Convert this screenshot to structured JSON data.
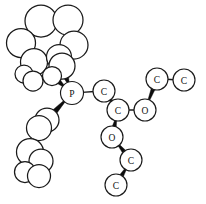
{
  "figure": {
    "background_color": "#ffffff",
    "stroke_color": "#1a1a1a",
    "bond_color": "#0d0d0d",
    "width": 206,
    "height": 204
  },
  "atoms": [
    {
      "id": "p1",
      "label": "P",
      "x": 72,
      "y": 93,
      "r": 11.5,
      "kind": "labeled"
    },
    {
      "id": "c1",
      "label": "C",
      "x": 104,
      "y": 91,
      "r": 11.0,
      "kind": "labeled"
    },
    {
      "id": "c2",
      "label": "C",
      "x": 118,
      "y": 110,
      "r": 11.0,
      "kind": "labeled"
    },
    {
      "id": "o1",
      "label": "O",
      "x": 145,
      "y": 110,
      "r": 11.0,
      "kind": "labeled"
    },
    {
      "id": "c3",
      "label": "C",
      "x": 157,
      "y": 79,
      "r": 11.0,
      "kind": "labeled"
    },
    {
      "id": "c4",
      "label": "C",
      "x": 184,
      "y": 80,
      "r": 11.0,
      "kind": "labeled"
    },
    {
      "id": "o2",
      "label": "O",
      "x": 112,
      "y": 137,
      "r": 11.0,
      "kind": "labeled"
    },
    {
      "id": "c5",
      "label": "C",
      "x": 131,
      "y": 160,
      "r": 11.0,
      "kind": "labeled"
    },
    {
      "id": "c6",
      "label": "C",
      "x": 116,
      "y": 185,
      "r": 11.0,
      "kind": "labeled"
    },
    {
      "id": "r1",
      "label": "",
      "x": 41,
      "y": 21,
      "r": 16.0,
      "kind": "plain"
    },
    {
      "id": "r2",
      "label": "",
      "x": 68,
      "y": 20,
      "r": 15.0,
      "kind": "plain"
    },
    {
      "id": "r3",
      "label": "",
      "x": 21,
      "y": 43,
      "r": 14.5,
      "kind": "plain"
    },
    {
      "id": "r4",
      "label": "",
      "x": 74,
      "y": 45,
      "r": 14.0,
      "kind": "plain"
    },
    {
      "id": "r5",
      "label": "",
      "x": 34,
      "y": 62,
      "r": 13.5,
      "kind": "plain"
    },
    {
      "id": "r6",
      "label": "",
      "x": 59,
      "y": 57,
      "r": 12.5,
      "kind": "plain"
    },
    {
      "id": "r7",
      "label": "",
      "x": 62,
      "y": 66,
      "r": 13.0,
      "kind": "plain"
    },
    {
      "id": "r8",
      "label": "",
      "x": 24,
      "y": 74,
      "r": 9.0,
      "kind": "plain"
    },
    {
      "id": "r9",
      "label": "",
      "x": 33,
      "y": 81,
      "r": 10.0,
      "kind": "plain"
    },
    {
      "id": "r10",
      "label": "",
      "x": 52,
      "y": 76,
      "r": 9.5,
      "kind": "plain"
    },
    {
      "id": "s1",
      "label": "",
      "x": 47,
      "y": 120,
      "r": 12.0,
      "kind": "plain"
    },
    {
      "id": "s2",
      "label": "",
      "x": 39,
      "y": 128,
      "r": 12.5,
      "kind": "plain"
    },
    {
      "id": "s3",
      "label": "",
      "x": 30,
      "y": 152,
      "r": 13.5,
      "kind": "plain"
    },
    {
      "id": "s4",
      "label": "",
      "x": 41,
      "y": 161,
      "r": 12.0,
      "kind": "plain"
    },
    {
      "id": "s5",
      "label": "",
      "x": 25,
      "y": 172,
      "r": 10.5,
      "kind": "plain"
    },
    {
      "id": "s6",
      "label": "",
      "x": 39,
      "y": 176,
      "r": 11.5,
      "kind": "plain"
    }
  ],
  "bonds": [
    {
      "from": "p1",
      "to": "c1",
      "style": "thin"
    },
    {
      "from": "c1",
      "to": "c2",
      "style": "wedge",
      "w1": 1.6,
      "w2": 4.2
    },
    {
      "from": "c2",
      "to": "o1",
      "style": "thin"
    },
    {
      "from": "o1",
      "to": "c3",
      "style": "wedge",
      "w1": 1.6,
      "w2": 4.2
    },
    {
      "from": "c3",
      "to": "c4",
      "style": "thin"
    },
    {
      "from": "c2",
      "to": "o2",
      "style": "wedge",
      "w1": 1.6,
      "w2": 4.4
    },
    {
      "from": "o2",
      "to": "c5",
      "style": "wedge",
      "w1": 1.6,
      "w2": 4.4
    },
    {
      "from": "c5",
      "to": "c6",
      "style": "wedge",
      "w1": 1.6,
      "w2": 4.4
    },
    {
      "from": "p1",
      "to": "r7",
      "style": "wedge",
      "w1": 1.6,
      "w2": 5.2
    },
    {
      "from": "p1",
      "to": "r10",
      "style": "wedge",
      "w1": 1.6,
      "w2": 5.0
    },
    {
      "from": "r7",
      "to": "r4",
      "style": "wedge",
      "w1": 1.6,
      "w2": 4.8
    },
    {
      "from": "r7",
      "to": "r6",
      "style": "wedge",
      "w1": 1.6,
      "w2": 4.2
    },
    {
      "from": "r6",
      "to": "r5",
      "style": "wedge",
      "w1": 1.6,
      "w2": 4.4
    },
    {
      "from": "r5",
      "to": "r3",
      "style": "wedge",
      "w1": 1.6,
      "w2": 4.6
    },
    {
      "from": "r3",
      "to": "r1",
      "style": "wedge",
      "w1": 1.6,
      "w2": 5.0
    },
    {
      "from": "r1",
      "to": "r2",
      "style": "thin"
    },
    {
      "from": "r2",
      "to": "r4",
      "style": "thin"
    },
    {
      "from": "r5",
      "to": "r9",
      "style": "thin"
    },
    {
      "from": "r9",
      "to": "r10",
      "style": "wedge",
      "w1": 1.6,
      "w2": 4.0
    },
    {
      "from": "r8",
      "to": "r9",
      "style": "thin"
    },
    {
      "from": "p1",
      "to": "s1",
      "style": "wedge",
      "w1": 1.6,
      "w2": 5.4
    },
    {
      "from": "s1",
      "to": "s2",
      "style": "thin"
    },
    {
      "from": "s2",
      "to": "s3",
      "style": "wedge",
      "w1": 1.6,
      "w2": 5.0
    },
    {
      "from": "s3",
      "to": "s4",
      "style": "thin"
    },
    {
      "from": "s4",
      "to": "s6",
      "style": "thin"
    },
    {
      "from": "s3",
      "to": "s5",
      "style": "thin"
    }
  ]
}
